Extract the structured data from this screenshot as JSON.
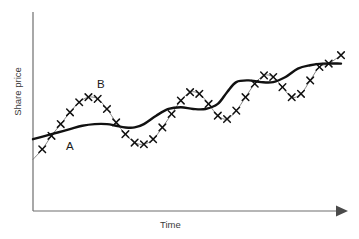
{
  "chart_data": {
    "type": "line",
    "title": "",
    "subtitle": "",
    "xlabel": "Time",
    "ylabel": "Share price",
    "grid": false,
    "legend_position": "inline-annotation",
    "axes": {
      "x_axis_style": "arrow",
      "y_axis_style": "plain",
      "x_tick_labels": [],
      "y_tick_labels": [],
      "xlim": [
        0,
        100
      ],
      "ylim": [
        0,
        100
      ]
    },
    "annotations": [
      {
        "text": "A",
        "x": 11,
        "y": 34,
        "describes": "smoothed-trend-curve"
      },
      {
        "text": "B",
        "x": 21,
        "y": 65,
        "describes": "raw-share-price-series"
      }
    ],
    "series": [
      {
        "name": "A",
        "label": "A",
        "role": "moving-average-trend",
        "style": "thick-solid-black",
        "markers": "none",
        "x": [
          0,
          4,
          8,
          12,
          16,
          20,
          24,
          27,
          30,
          33,
          36,
          40,
          44,
          48,
          52,
          56,
          60,
          63,
          66,
          70,
          74,
          78,
          82,
          86,
          90,
          94,
          100
        ],
        "y": [
          35,
          37,
          39,
          41,
          43,
          44,
          44,
          43,
          42,
          42,
          44,
          49,
          53,
          54,
          53,
          53,
          56,
          63,
          69,
          70,
          69,
          69,
          72,
          77,
          79,
          80,
          80
        ]
      },
      {
        "name": "B",
        "label": "B",
        "role": "actual-share-price",
        "style": "thin-solid-grey",
        "markers": "x-cross",
        "x": [
          0,
          3,
          6,
          9,
          12,
          15,
          18,
          21,
          24,
          27,
          30,
          33,
          36,
          39,
          42,
          45,
          48,
          51,
          54,
          57,
          60,
          63,
          66,
          69,
          72,
          75,
          78,
          81,
          84,
          87,
          90,
          93,
          96,
          100
        ],
        "y": [
          23,
          29,
          37,
          44,
          51,
          57,
          60,
          59,
          53,
          45,
          38,
          33,
          32,
          35,
          42,
          50,
          58,
          63,
          62,
          56,
          49,
          47,
          52,
          60,
          68,
          73,
          72,
          66,
          60,
          62,
          70,
          78,
          80,
          85
        ]
      }
    ]
  },
  "labels": {
    "y_axis": "Share price",
    "x_axis": "Time",
    "curve_a": "A",
    "curve_b": "B"
  },
  "colors": {
    "background": "#ffffff",
    "axis": "#6e6e6e",
    "trend_curve": "#111111",
    "raw_curve": "#6f6f6f",
    "marker": "#111111",
    "text": "#3a3a3a"
  }
}
